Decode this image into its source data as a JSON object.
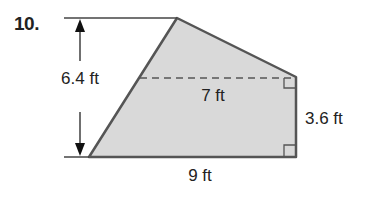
{
  "problem": {
    "number": "10."
  },
  "figure": {
    "type": "composite-shape",
    "fill_color": "#d9d9d9",
    "stroke_color": "#555555",
    "labels": {
      "height": "6.4 ft",
      "dashed_width": "7 ft",
      "right_side": "3.6 ft",
      "base": "9 ft"
    },
    "dimensions": {
      "height_ft": 6.4,
      "dashed_width_ft": 7,
      "right_side_ft": 3.6,
      "base_ft": 9
    }
  }
}
